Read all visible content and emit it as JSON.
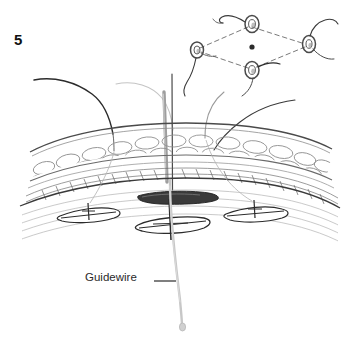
{
  "figure": {
    "number": "5",
    "domain_type": "medical-surgical-illustration",
    "background_color": "#ffffff",
    "width": 352,
    "height": 350
  },
  "labels": {
    "guidewire": "Guidewire"
  },
  "colors": {
    "ink_dark": "#2b2b2b",
    "ink_mid": "#6d6d6d",
    "ink_light": "#b9b9b9",
    "ink_faint": "#d9d9d9",
    "guidewire": "#c2c2c2",
    "fat_outline": "#9a9a9a",
    "fascia_dark": "#3a3a3a",
    "dashed_line": "#7a7a7a"
  },
  "inset_diagram": {
    "shape": "diamond",
    "center_dot": {
      "x": 252,
      "y": 47
    },
    "vertices": [
      {
        "name": "top",
        "x": 252,
        "y": 24
      },
      {
        "name": "right",
        "x": 309,
        "y": 44
      },
      {
        "name": "bottom",
        "x": 252,
        "y": 70
      },
      {
        "name": "left",
        "x": 197,
        "y": 50
      }
    ],
    "vertex_count": 4,
    "connector_style": "dashed"
  },
  "anatomy": {
    "layers": [
      {
        "name": "subcutaneous-fat",
        "top": 128,
        "bottom": 180
      },
      {
        "name": "fascia-muscle",
        "top": 180,
        "bottom": 240
      }
    ],
    "deep_anchor_count": 3
  },
  "instruments": {
    "guidewire_present": true,
    "dilator_present": true,
    "suture_thread_count": 4
  }
}
